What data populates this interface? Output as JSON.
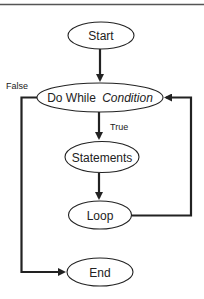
{
  "diagram": {
    "nodes": {
      "start": {
        "label": "Start"
      },
      "condition": {
        "label_prefix": "Do While",
        "label_italic": "Condition"
      },
      "statements": {
        "label": "Statements"
      },
      "loop": {
        "label": "Loop"
      },
      "end": {
        "label": "End"
      }
    },
    "edges": {
      "true_label": "True",
      "false_label": "False"
    },
    "colors": {
      "stroke": "#222222",
      "fill": "#ffffff",
      "rule": "#555555"
    }
  }
}
